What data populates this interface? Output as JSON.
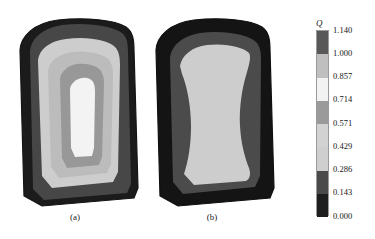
{
  "figure": {
    "scan_artifact_text": "·  ·· ·   ···· ··  ·· ···",
    "panels": [
      {
        "id": "a",
        "caption": "(a)"
      },
      {
        "id": "b",
        "caption": "(b)"
      }
    ]
  },
  "colorbar": {
    "title": "Q",
    "tick_labels": [
      "1.140",
      "1.000",
      "0.857",
      "0.714",
      "0.571",
      "0.429",
      "0.286",
      "0.143",
      "0.000"
    ],
    "band_colors": [
      "#585858",
      "#bfbfbf",
      "#f2f2f2",
      "#9a9a9a",
      "#d2d2d2",
      "#cfcfcf",
      "#4a4a4a",
      "#1e1e1e"
    ],
    "band_ranges": [
      "1.000-1.140",
      "0.857-1.000",
      "0.714-0.857",
      "0.571-0.714",
      "0.429-0.571",
      "0.286-0.429",
      "0.143-0.286",
      "0.000-0.143"
    ]
  },
  "chart_data": {
    "type": "heatmap",
    "title": "",
    "subtitle": "",
    "xlabel": "",
    "ylabel": "",
    "grid": false,
    "legend_position": "right",
    "colorbar": {
      "label": "Q",
      "min": 0.0,
      "max": 1.14,
      "levels": [
        0.0,
        0.143,
        0.286,
        0.429,
        0.571,
        0.714,
        0.857,
        1.0,
        1.14
      ],
      "n_bands": 8,
      "colors": [
        "#1e1e1e",
        "#4a4a4a",
        "#cfcfcf",
        "#d2d2d2",
        "#9a9a9a",
        "#f2f2f2",
        "#bfbfbf",
        "#585858"
      ]
    },
    "panels": [
      {
        "name": "(a)",
        "description": "Contour field on a rounded-top trapezoidal cross-section with concentric nested bands and a bright elongated core",
        "contour_bands": [
          {
            "level_range": [
              0.0,
              0.143
            ],
            "color": "#1e1e1e",
            "region": "outer-boundary"
          },
          {
            "level_range": [
              0.143,
              0.286
            ],
            "color": "#4a4a4a",
            "region": "second-ring"
          },
          {
            "level_range": [
              0.286,
              0.429
            ],
            "color": "#cfcfcf",
            "region": "wide-mid-ring"
          },
          {
            "level_range": [
              0.429,
              0.571
            ],
            "color": "#bdbdbd",
            "region": "inner-ring"
          },
          {
            "level_range": [
              0.571,
              0.714
            ],
            "color": "#9a9a9a",
            "region": "core-ring"
          },
          {
            "level_range": [
              0.714,
              0.857
            ],
            "color": "#f2f2f2",
            "region": "bright-core"
          }
        ],
        "peak_value": 0.857,
        "peak_location": "center, slightly above mid-height",
        "edge_value": 0.0
      },
      {
        "name": "(b)",
        "description": "Contour field on a rounded-top trapezoidal cross-section with a single broad uniform interior plateau and narrow dark boundary layer",
        "contour_bands": [
          {
            "level_range": [
              0.0,
              0.143
            ],
            "color": "#1e1e1e",
            "region": "outer-boundary"
          },
          {
            "level_range": [
              0.143,
              0.286
            ],
            "color": "#4a4a4a",
            "region": "second-ring"
          },
          {
            "level_range": [
              0.286,
              0.429
            ],
            "color": "#cfcfcf",
            "region": "broad-interior-plateau"
          }
        ],
        "peak_value": 0.429,
        "peak_location": "broad central plateau",
        "edge_value": 0.0
      }
    ]
  }
}
